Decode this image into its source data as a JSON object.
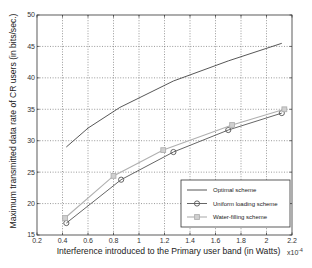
{
  "chart_data": {
    "type": "line",
    "title": "",
    "xlabel": "Interference introduced to the Primary user band (in Watts)",
    "x_multiplier": "x10^-4",
    "ylabel": "Maximum transmitted data rate of CR users (in bits/sec.)",
    "xlim": [
      0.2,
      2.2
    ],
    "ylim": [
      15,
      50
    ],
    "xticks": [
      "0.2",
      "0.4",
      "0.6",
      "0.8",
      "1",
      "1.2",
      "1.4",
      "1.6",
      "1.8",
      "2",
      "2.2"
    ],
    "yticks": [
      "15",
      "20",
      "25",
      "30",
      "35",
      "40",
      "45",
      "50"
    ],
    "grid": true,
    "legend_position": "bottom-right",
    "series": [
      {
        "name": "Optimal scheme",
        "color": "#444444",
        "marker": "none",
        "x": [
          0.43,
          0.6,
          0.85,
          1.27,
          1.7,
          2.12
        ],
        "y": [
          29.0,
          32.0,
          35.3,
          39.5,
          42.7,
          45.5
        ]
      },
      {
        "name": "Uniform loading scheme",
        "color": "#555555",
        "marker": "circle",
        "x": [
          0.43,
          0.86,
          1.27,
          1.7,
          2.12
        ],
        "y": [
          16.9,
          23.8,
          28.2,
          31.7,
          34.4
        ]
      },
      {
        "name": "Water-filling scheme",
        "color": "#b0b0b0",
        "marker": "square",
        "x": [
          0.42,
          0.8,
          1.19,
          1.73,
          2.14
        ],
        "y": [
          17.7,
          24.4,
          28.5,
          32.5,
          35.0
        ]
      }
    ]
  }
}
